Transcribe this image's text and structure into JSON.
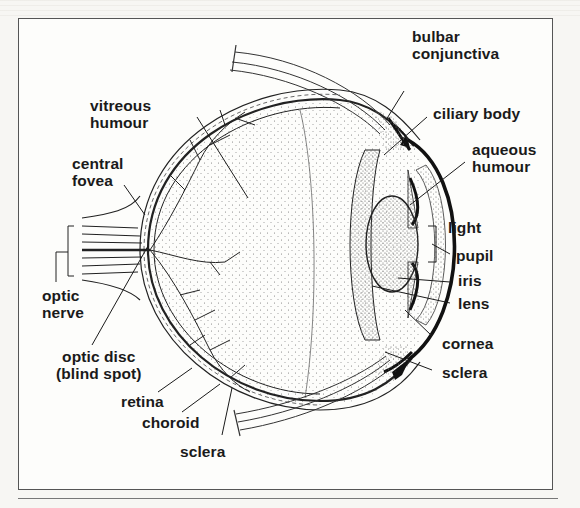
{
  "figure": {
    "type": "labeled anatomical diagram",
    "labels": {
      "bulbar_conjunctiva": [
        "bulbar",
        "conjunctiva"
      ],
      "ciliary_body": [
        "ciliary body"
      ],
      "aqueous_humour": [
        "aqueous",
        "humour"
      ],
      "light": [
        "light"
      ],
      "pupil": [
        "pupil"
      ],
      "iris": [
        "iris"
      ],
      "lens": [
        "lens"
      ],
      "cornea": [
        "cornea"
      ],
      "sclera_right": [
        "sclera"
      ],
      "vitreous_humour": [
        "vitreous",
        "humour"
      ],
      "central_fovea": [
        "central",
        "fovea"
      ],
      "optic_nerve": [
        "optic",
        "nerve"
      ],
      "optic_disc": [
        "optic disc",
        "(blind spot)"
      ],
      "retina": [
        "retina"
      ],
      "choroid": [
        "choroid"
      ],
      "sclera_bottom": [
        "sclera"
      ]
    },
    "colors": {
      "ink": "#1a1a1a",
      "paper": "#fdfdfb",
      "stipple": "#8a8a8a",
      "frame": "#555555"
    }
  }
}
